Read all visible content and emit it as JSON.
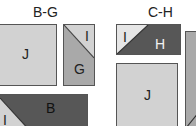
{
  "colors": {
    "light": "#d2d2d2",
    "medium": "#a9a9a9",
    "dark": "#575757",
    "pale": "#e6e6e6",
    "border": "#555555"
  },
  "groups": [
    {
      "title": "B-G",
      "blocks": [
        {
          "id": "J",
          "label": "J"
        },
        {
          "id": "GI",
          "labels": [
            "I",
            "G"
          ]
        },
        {
          "id": "BI",
          "labels": [
            "I",
            "B"
          ]
        }
      ]
    },
    {
      "title": "C-H",
      "blocks": [
        {
          "id": "IH",
          "labels": [
            "I",
            "H"
          ]
        },
        {
          "id": "J",
          "label": "J"
        },
        {
          "id": "partial",
          "label": ""
        }
      ]
    }
  ]
}
